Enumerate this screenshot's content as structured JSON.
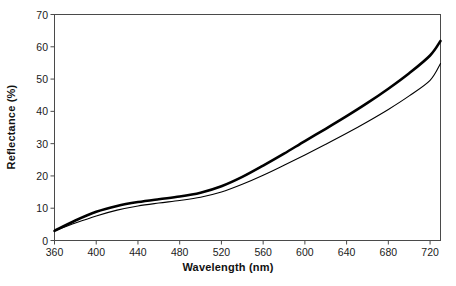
{
  "chart_data": {
    "type": "line",
    "title": "",
    "xlabel": "Wavelength (nm)",
    "ylabel": "Reflectance (%)",
    "xlim": [
      360,
      730
    ],
    "ylim": [
      0,
      70
    ],
    "xticks": [
      360,
      400,
      440,
      480,
      520,
      560,
      600,
      640,
      680,
      720
    ],
    "yticks": [
      0,
      10,
      20,
      30,
      40,
      50,
      60,
      70
    ],
    "xtick_labels": [
      "360",
      "400",
      "440",
      "480",
      "520",
      "560",
      "600",
      "640",
      "680",
      "720"
    ],
    "ytick_labels": [
      "0",
      "10",
      "20",
      "30",
      "40",
      "50",
      "60",
      "70"
    ],
    "grid": false,
    "legend": "none",
    "frame": "full-box",
    "x": [
      360,
      380,
      400,
      420,
      440,
      460,
      480,
      500,
      520,
      540,
      560,
      580,
      600,
      620,
      640,
      660,
      680,
      700,
      720,
      730
    ],
    "series": [
      {
        "name": "upper-curve",
        "style": "thick-solid-black",
        "color": "#000000",
        "line_width": 2.6,
        "values": [
          3.0,
          6.2,
          8.9,
          10.7,
          11.9,
          12.8,
          13.6,
          14.8,
          16.8,
          19.7,
          23.2,
          26.9,
          30.8,
          34.6,
          38.5,
          42.6,
          47.0,
          51.8,
          57.3,
          61.8
        ]
      },
      {
        "name": "lower-curve",
        "style": "thin-solid-black",
        "color": "#000000",
        "line_width": 1.1,
        "values": [
          3.0,
          5.4,
          7.6,
          9.4,
          10.7,
          11.6,
          12.4,
          13.4,
          15.0,
          17.4,
          20.2,
          23.3,
          26.5,
          29.8,
          33.2,
          36.8,
          40.6,
          44.8,
          49.6,
          54.8
        ]
      }
    ]
  }
}
